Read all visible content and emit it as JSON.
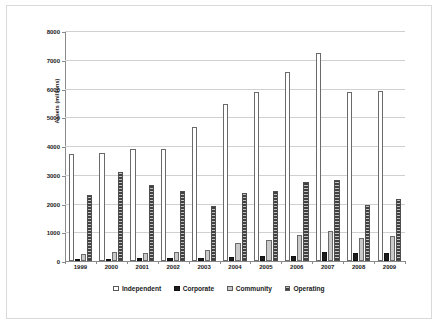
{
  "chart_data": {
    "type": "bar",
    "title": "",
    "xlabel": "",
    "ylabel": "Assets (millions)",
    "ylim": [
      0,
      8000
    ],
    "ytick_labels": [
      "8000",
      "7000",
      "6000",
      "5000",
      "4000",
      "3000",
      "2000",
      "1000",
      "0"
    ],
    "ytick_values": [
      8000,
      7000,
      6000,
      5000,
      4000,
      3000,
      2000,
      1000,
      0
    ],
    "grid": true,
    "legend_position": "bottom",
    "categories": [
      "1999",
      "2000",
      "2001",
      "2002",
      "2003",
      "2004",
      "2005",
      "2006",
      "2007",
      "2008",
      "2009"
    ],
    "series": [
      {
        "name": "Independent",
        "color": "#ffffff",
        "pattern": "solid-white",
        "values": [
          3720,
          3740,
          3880,
          3900,
          4650,
          5470,
          5880,
          6580,
          7220,
          5880,
          5910
        ]
      },
      {
        "name": "Corporate",
        "color": "#1c1c1c",
        "pattern": "solid-black",
        "values": [
          60,
          80,
          120,
          110,
          110,
          140,
          160,
          170,
          320,
          290,
          270
        ]
      },
      {
        "name": "Community",
        "color": "#c9c9c9",
        "pattern": "light-grey",
        "values": [
          260,
          310,
          290,
          330,
          370,
          640,
          740,
          900,
          1030,
          810,
          880
        ]
      },
      {
        "name": "Operating",
        "color": "#8f8f8f",
        "pattern": "horizontal-hatch",
        "values": [
          2300,
          3100,
          2630,
          2450,
          1900,
          2380,
          2450,
          2760,
          2820,
          1950,
          2140
        ]
      }
    ]
  },
  "legend": {
    "items": [
      {
        "label": "Independent",
        "key": "independent"
      },
      {
        "label": "Corporate",
        "key": "corporate"
      },
      {
        "label": "Community",
        "key": "community"
      },
      {
        "label": "Operating",
        "key": "operating"
      }
    ]
  }
}
